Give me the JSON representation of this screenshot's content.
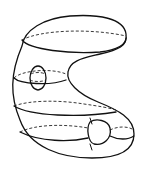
{
  "figure": {
    "colors": {
      "stroke": "#111111",
      "background": "#ffffff"
    },
    "features": [
      {
        "name": "outer-surface-outline",
        "style": "solid"
      },
      {
        "name": "top-cross-section",
        "style": "solid-front/dashed-back"
      },
      {
        "name": "upper-left-cross-section",
        "style": "solid-front/dashed-back"
      },
      {
        "name": "middle-cross-section",
        "style": "solid-front/dashed-back"
      },
      {
        "name": "lower-cross-section",
        "style": "solid-front/dashed-back"
      },
      {
        "name": "left-bubble",
        "style": "solid-outline/dashed-interior"
      },
      {
        "name": "right-bubble",
        "style": "solid-outline"
      }
    ]
  }
}
